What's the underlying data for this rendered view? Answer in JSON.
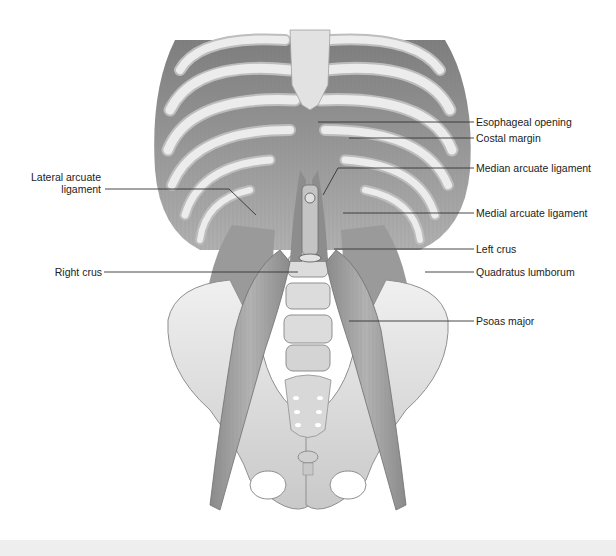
{
  "figure": {
    "colors": {
      "background": "#ffffff",
      "bone": "#e4e4e4",
      "bone_shadow": "#a8a8a8",
      "muscle": "#9c9c9c",
      "muscle_dark": "#6e6e6e",
      "leader_line": "#333333",
      "label_text": "#222222",
      "caption_band": "#eeeeee"
    }
  },
  "labels": {
    "right_side": [
      {
        "id": "esophageal-opening",
        "text": "Esophageal opening"
      },
      {
        "id": "costal-margin",
        "text": "Costal margin"
      },
      {
        "id": "median-arcuate-ligament",
        "text": "Median arcuate ligament"
      },
      {
        "id": "medial-arcuate-ligament",
        "text": "Medial arcuate ligament"
      },
      {
        "id": "left-crus",
        "text": "Left crus"
      },
      {
        "id": "quadratus-lumborum",
        "text": "Quadratus lumborum"
      },
      {
        "id": "psoas-major",
        "text": "Psoas major"
      }
    ],
    "left_side": [
      {
        "id": "lateral-arcuate-ligament",
        "line1": "Lateral arcuate",
        "line2": "ligament"
      },
      {
        "id": "right-crus",
        "text": "Right crus"
      }
    ]
  },
  "caption": {
    "text": ""
  }
}
